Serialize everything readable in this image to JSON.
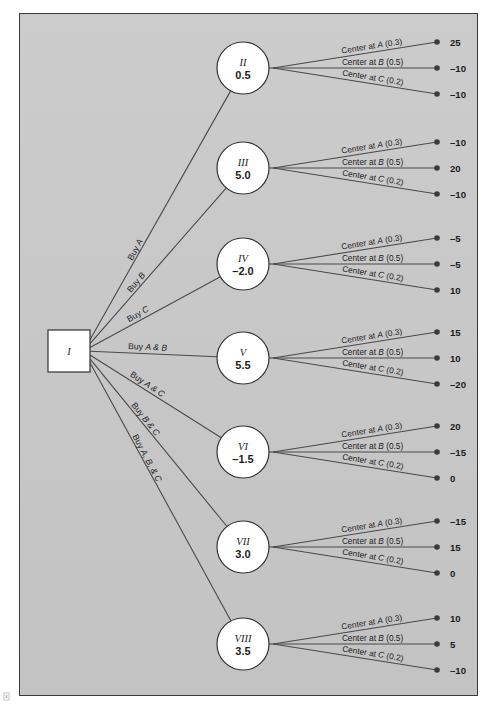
{
  "figure": {
    "type": "decision-tree",
    "background_color": "#c9c9c9",
    "page_color": "#ffffff",
    "border_color": "#3a3a3a",
    "line_color": "#4a4a4a",
    "node_fill": "#ffffff",
    "terminal_dot_color": "#3b3b3b"
  },
  "root": {
    "label": "I",
    "shape": "square"
  },
  "chance_labels": {
    "a": "Center at A",
    "b": "Center at B",
    "c": "Center at C",
    "prob_a": "(0.3)",
    "prob_b": "(0.5)",
    "prob_c": "(0.2)"
  },
  "branches": [
    {
      "label_plain": "Buy A",
      "label_prefix": "Buy ",
      "label_italic": "A",
      "label_suffix": ""
    },
    {
      "label_plain": "Buy B",
      "label_prefix": "Buy ",
      "label_italic": "B",
      "label_suffix": ""
    },
    {
      "label_plain": "Buy C",
      "label_prefix": "Buy ",
      "label_italic": "C",
      "label_suffix": ""
    },
    {
      "label_plain": "Buy A & B",
      "label_prefix": "Buy ",
      "label_italic": "A & B",
      "label_suffix": ""
    },
    {
      "label_plain": "Buy A & C",
      "label_prefix": "Buy ",
      "label_italic": "A & C",
      "label_suffix": ""
    },
    {
      "label_plain": "Buy B & C",
      "label_prefix": "Buy ",
      "label_italic": "B & C",
      "label_suffix": ""
    },
    {
      "label_plain": "Buy A, B, & C",
      "label_prefix": "Buy ",
      "label_italic": "A, B, & C",
      "label_suffix": ""
    }
  ],
  "nodes": [
    {
      "roman": "II",
      "value": "0.5",
      "payoffs": [
        "25",
        "–10",
        "–10"
      ]
    },
    {
      "roman": "III",
      "value": "5.0",
      "payoffs": [
        "–10",
        "20",
        "–10"
      ]
    },
    {
      "roman": "IV",
      "value": "–2.0",
      "payoffs": [
        "–5",
        "–5",
        "10"
      ]
    },
    {
      "roman": "V",
      "value": "5.5",
      "payoffs": [
        "15",
        "10",
        "–20"
      ]
    },
    {
      "roman": "VI",
      "value": "–1.5",
      "payoffs": [
        "20",
        "–15",
        "0"
      ]
    },
    {
      "roman": "VII",
      "value": "3.0",
      "payoffs": [
        "–15",
        "15",
        "0"
      ]
    },
    {
      "roman": "VIII",
      "value": "3.5",
      "payoffs": [
        "10",
        "5",
        "–10"
      ]
    }
  ],
  "chart_data": {
    "type": "diagram",
    "decision_node": "I",
    "alternatives": [
      {
        "decision": "Buy A",
        "chance_node": "II",
        "expected_value": 0.5,
        "outcomes": [
          {
            "state": "Center at A",
            "probability": 0.3,
            "payoff": 25
          },
          {
            "state": "Center at B",
            "probability": 0.5,
            "payoff": -10
          },
          {
            "state": "Center at C",
            "probability": 0.2,
            "payoff": -10
          }
        ]
      },
      {
        "decision": "Buy B",
        "chance_node": "III",
        "expected_value": 5.0,
        "outcomes": [
          {
            "state": "Center at A",
            "probability": 0.3,
            "payoff": -10
          },
          {
            "state": "Center at B",
            "probability": 0.5,
            "payoff": 20
          },
          {
            "state": "Center at C",
            "probability": 0.2,
            "payoff": -10
          }
        ]
      },
      {
        "decision": "Buy C",
        "chance_node": "IV",
        "expected_value": -2.0,
        "outcomes": [
          {
            "state": "Center at A",
            "probability": 0.3,
            "payoff": -5
          },
          {
            "state": "Center at B",
            "probability": 0.5,
            "payoff": -5
          },
          {
            "state": "Center at C",
            "probability": 0.2,
            "payoff": 10
          }
        ]
      },
      {
        "decision": "Buy A & B",
        "chance_node": "V",
        "expected_value": 5.5,
        "outcomes": [
          {
            "state": "Center at A",
            "probability": 0.3,
            "payoff": 15
          },
          {
            "state": "Center at B",
            "probability": 0.5,
            "payoff": 10
          },
          {
            "state": "Center at C",
            "probability": 0.2,
            "payoff": -20
          }
        ]
      },
      {
        "decision": "Buy A & C",
        "chance_node": "VI",
        "expected_value": -1.5,
        "outcomes": [
          {
            "state": "Center at A",
            "probability": 0.3,
            "payoff": 20
          },
          {
            "state": "Center at B",
            "probability": 0.5,
            "payoff": -15
          },
          {
            "state": "Center at C",
            "probability": 0.2,
            "payoff": 0
          }
        ]
      },
      {
        "decision": "Buy B & C",
        "chance_node": "VII",
        "expected_value": 3.0,
        "outcomes": [
          {
            "state": "Center at A",
            "probability": 0.3,
            "payoff": -15
          },
          {
            "state": "Center at B",
            "probability": 0.5,
            "payoff": 15
          },
          {
            "state": "Center at C",
            "probability": 0.2,
            "payoff": 0
          }
        ]
      },
      {
        "decision": "Buy A, B, & C",
        "chance_node": "VIII",
        "expected_value": 3.5,
        "outcomes": [
          {
            "state": "Center at A",
            "probability": 0.3,
            "payoff": 10
          },
          {
            "state": "Center at B",
            "probability": 0.5,
            "payoff": 5
          },
          {
            "state": "Center at C",
            "probability": 0.2,
            "payoff": -10
          }
        ]
      }
    ]
  }
}
